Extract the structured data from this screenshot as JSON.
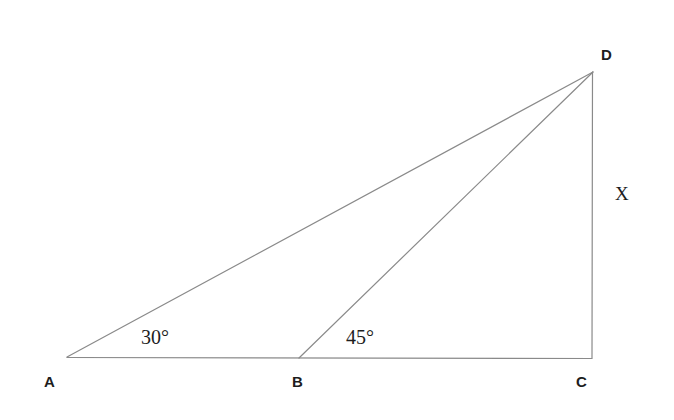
{
  "figure": {
    "type": "geometry-diagram",
    "background_color": "#ffffff",
    "stroke_color": "#8a8a8a",
    "text_color": "#1d1d1d"
  },
  "vertices": [
    {
      "id": "A",
      "label": "A",
      "x": 67,
      "y": 357
    },
    {
      "id": "B",
      "label": "B",
      "x": 299,
      "y": 358
    },
    {
      "id": "C",
      "label": "C",
      "x": 592,
      "y": 358
    },
    {
      "id": "D",
      "label": "D",
      "x": 593,
      "y": 72
    }
  ],
  "segments": [
    {
      "id": "AC",
      "from": "A",
      "to": "C",
      "x1": 67,
      "y1": 357,
      "x2": 592,
      "y2": 358
    },
    {
      "id": "AD",
      "from": "A",
      "to": "D",
      "x1": 67,
      "y1": 357,
      "x2": 593,
      "y2": 72
    },
    {
      "id": "BD",
      "from": "B",
      "to": "D",
      "x1": 299,
      "y1": 358,
      "x2": 593,
      "y2": 72
    },
    {
      "id": "DC",
      "from": "D",
      "to": "C",
      "x1": 593,
      "y1": 72,
      "x2": 592,
      "y2": 358
    }
  ],
  "angles": [
    {
      "id": "angle-at-A",
      "at_vertex": "A",
      "label": "30°",
      "value": 30,
      "unit": "degrees"
    },
    {
      "id": "angle-at-B",
      "at_vertex": "B",
      "label": "45°",
      "value": 45,
      "unit": "degrees"
    }
  ],
  "side_labels": [
    {
      "id": "side-DC",
      "segment": "DC",
      "label": "X"
    }
  ]
}
